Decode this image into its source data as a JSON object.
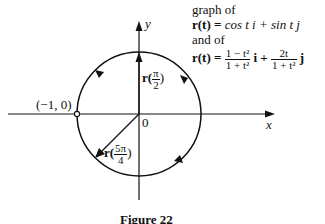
{
  "figure": {
    "caption": "Figure 22",
    "description_lines": {
      "line1": "graph of",
      "line2_lhs": "r(t) =",
      "line2_rhs": "cos t i + sin t j",
      "line3": "and of",
      "line4_lhs": "r(t) =",
      "line4_frac1_num": "1 − t²",
      "line4_frac1_den": "1 + t²",
      "line4_mid": "i +",
      "line4_frac2_num": "2t",
      "line4_frac2_den": "1 + t²",
      "line4_end": "j"
    },
    "axes": {
      "x_label": "x",
      "y_label": "y",
      "origin_label": "0"
    },
    "points": {
      "neg_one_label": "(−1, 0)",
      "r_pi2_prefix": "r(",
      "r_pi2_num": "π",
      "r_pi2_den": "2",
      "r_pi2_suffix": ")",
      "r_5pi4_prefix": "r(",
      "r_5pi4_num": "5π",
      "r_5pi4_den": "4",
      "r_5pi4_suffix": ")"
    },
    "colors": {
      "ink": "#111111",
      "background": "#ffffff"
    }
  }
}
